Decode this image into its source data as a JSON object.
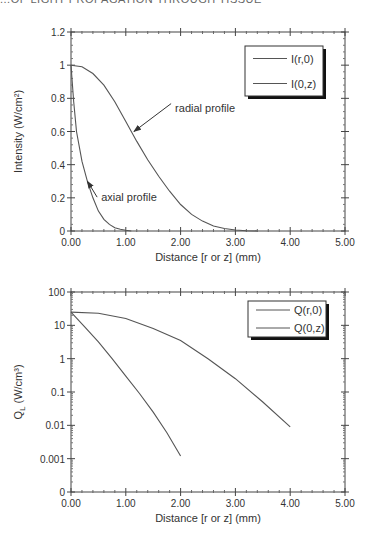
{
  "header": {
    "cut_text": "...OF LIGHT PROPAGATION THROUGH TISSUE"
  },
  "chart_data": [
    {
      "type": "line",
      "title": "",
      "xlabel": "Distance [r or z] (mm)",
      "ylabel": "Intensity (W/cm²)",
      "xlim": [
        0,
        5
      ],
      "ylim": [
        0,
        1.2
      ],
      "grid": false,
      "legend_position": "upper right",
      "x_ticks": [
        "0.00",
        "1.00",
        "2.00",
        "3.00",
        "4.00",
        "5.00"
      ],
      "y_ticks": [
        "0",
        "0.2",
        "0.4",
        "0.6",
        "0.8",
        "1",
        "1.2"
      ],
      "series": [
        {
          "name": "I(r,0)",
          "x": [
            0,
            0.2,
            0.4,
            0.6,
            0.8,
            1.0,
            1.2,
            1.4,
            1.6,
            1.8,
            2.0,
            2.2,
            2.4,
            2.6,
            2.8,
            3.0,
            3.2,
            3.4
          ],
          "y": [
            1.0,
            0.99,
            0.95,
            0.88,
            0.78,
            0.66,
            0.54,
            0.43,
            0.33,
            0.24,
            0.16,
            0.1,
            0.06,
            0.03,
            0.015,
            0.006,
            0.002,
            0.0
          ]
        },
        {
          "name": "I(0,z)",
          "x": [
            0,
            0.05,
            0.1,
            0.2,
            0.3,
            0.4,
            0.5,
            0.6,
            0.7,
            0.8,
            0.9,
            1.0,
            1.1
          ],
          "y": [
            1.0,
            0.78,
            0.6,
            0.42,
            0.3,
            0.2,
            0.12,
            0.07,
            0.04,
            0.02,
            0.01,
            0.004,
            0.0
          ]
        }
      ],
      "annotations": [
        {
          "text": "radial profile",
          "x": 1.9,
          "y": 0.72,
          "arrow_to": [
            1.15,
            0.6
          ]
        },
        {
          "text": "axial profile",
          "x": 0.55,
          "y": 0.18,
          "arrow_to": [
            0.3,
            0.3
          ]
        }
      ]
    },
    {
      "type": "line",
      "title": "",
      "xlabel": "Distance [r or z] (mm)",
      "ylabel": "Q_L (W/cm³)",
      "xlim": [
        0,
        5
      ],
      "yscale": "log",
      "ylim": [
        0.0001,
        100
      ],
      "grid": false,
      "legend_position": "upper right",
      "x_ticks": [
        "0.00",
        "1.00",
        "2.00",
        "3.00",
        "4.00",
        "5.00"
      ],
      "y_ticks": [
        "0",
        "0.001",
        "0.01",
        "0.1",
        "1",
        "10",
        "100"
      ],
      "series": [
        {
          "name": "Q(r,0)",
          "x": [
            0,
            0.5,
            1.0,
            1.5,
            2.0,
            2.5,
            3.0,
            3.5,
            4.0
          ],
          "y": [
            25,
            23,
            16,
            8,
            3.5,
            1.0,
            0.25,
            0.05,
            0.009
          ]
        },
        {
          "name": "Q(0,z)",
          "x": [
            0,
            0.25,
            0.5,
            0.75,
            1.0,
            1.25,
            1.5,
            1.75,
            2.0
          ],
          "y": [
            25,
            9,
            3.2,
            1.0,
            0.3,
            0.09,
            0.025,
            0.006,
            0.0012
          ]
        }
      ]
    }
  ]
}
